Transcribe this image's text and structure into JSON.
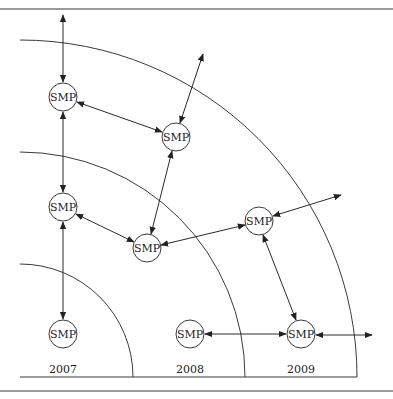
{
  "diagram": {
    "title": "",
    "colors": {
      "line": "#3a3a3a",
      "frame": "#9a9a9a",
      "background": "#ffffff"
    },
    "rings": [
      {
        "label": "2007",
        "radius": 113
      },
      {
        "label": "2008",
        "radius": 225
      },
      {
        "label": "2009",
        "radius": 337
      }
    ],
    "year_labels": [
      "2007",
      "2008",
      "2009"
    ],
    "nodes": [
      {
        "id": "A",
        "label": "SMP",
        "x": 63,
        "y": 97
      },
      {
        "id": "B",
        "label": "SMP",
        "x": 176,
        "y": 137
      },
      {
        "id": "C",
        "label": "SMP",
        "x": 63,
        "y": 207
      },
      {
        "id": "D",
        "label": "SMP",
        "x": 147,
        "y": 248
      },
      {
        "id": "E",
        "label": "SMP",
        "x": 259,
        "y": 221
      },
      {
        "id": "F",
        "label": "SMP",
        "x": 63,
        "y": 334
      },
      {
        "id": "G",
        "label": "SMP",
        "x": 190,
        "y": 334
      },
      {
        "id": "H",
        "label": "SMP",
        "x": 301,
        "y": 334
      }
    ],
    "edges": [
      {
        "from": "A",
        "to": "out-top",
        "direction": "both"
      },
      {
        "from": "A",
        "to": "C",
        "direction": "both"
      },
      {
        "from": "A",
        "to": "B",
        "direction": "both"
      },
      {
        "from": "B",
        "to": "out-upper-right",
        "direction": "both"
      },
      {
        "from": "B",
        "to": "D",
        "direction": "both"
      },
      {
        "from": "C",
        "to": "D",
        "direction": "both"
      },
      {
        "from": "C",
        "to": "F",
        "direction": "both"
      },
      {
        "from": "D",
        "to": "E",
        "direction": "both"
      },
      {
        "from": "E",
        "to": "out-right",
        "direction": "both"
      },
      {
        "from": "E",
        "to": "H",
        "direction": "both"
      },
      {
        "from": "G",
        "to": "H",
        "direction": "both"
      },
      {
        "from": "H",
        "to": "out-far-right",
        "direction": "both"
      }
    ]
  }
}
